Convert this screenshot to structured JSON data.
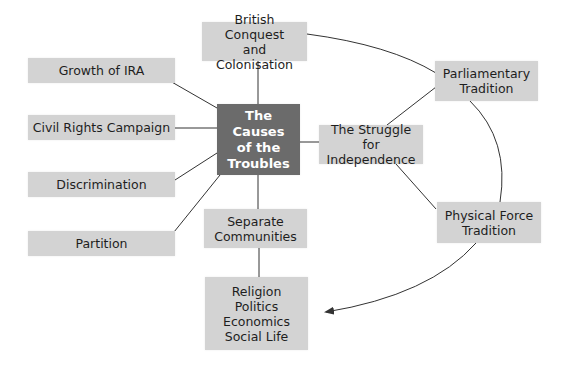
{
  "diagram": {
    "title": "The Causes of the Troubles",
    "central_node": {
      "label": "The Causes\nof the\nTroubles",
      "color": "#6b6b6b"
    },
    "nodes": {
      "british_conquest": "British Conquest\nand Colonisation",
      "growth_ira": "Growth of IRA",
      "civil_rights": "Civil Rights Campaign",
      "discrimination": "Discrimination",
      "partition": "Partition",
      "separate_communities": "Separate\nCommunities",
      "aspects": "Religion\nPolitics\nEconomics\nSocial Life",
      "struggle": "The Struggle for\nIndependence",
      "parliamentary": "Parliamentary\nTradition",
      "physical_force": "Physical Force\nTradition"
    },
    "edges": [
      [
        "central_node",
        "british_conquest"
      ],
      [
        "central_node",
        "growth_ira"
      ],
      [
        "central_node",
        "civil_rights"
      ],
      [
        "central_node",
        "discrimination"
      ],
      [
        "central_node",
        "partition"
      ],
      [
        "central_node",
        "separate_communities"
      ],
      [
        "central_node",
        "struggle"
      ],
      [
        "separate_communities",
        "aspects"
      ],
      [
        "struggle",
        "parliamentary"
      ],
      [
        "struggle",
        "physical_force"
      ],
      [
        "british_conquest",
        "parliamentary",
        "curve"
      ],
      [
        "parliamentary",
        "physical_force",
        "curve"
      ],
      [
        "physical_force",
        "aspects",
        "curved-arrow"
      ]
    ],
    "colors": {
      "node_fill": "#d3d3d3",
      "center_fill": "#6b6b6b",
      "line": "#333333"
    }
  }
}
